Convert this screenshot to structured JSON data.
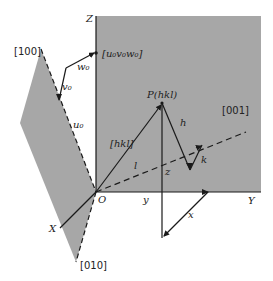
{
  "figure": {
    "type": "crystallographic direction diagram",
    "colors": {
      "plane_fill": "#a7a7a7",
      "line": "#1a1a1a",
      "background": "#ffffff"
    },
    "axes": {
      "z_label": "Z",
      "y_label": "Y",
      "x_label": "X",
      "origin_label": "O"
    },
    "directions": {
      "d100": "[100]",
      "d010": "[010]",
      "d001": "[001]",
      "uvw": "[u₀v₀w₀]",
      "hkl": "[hkl]"
    },
    "point": {
      "label": "P(hkl)"
    },
    "components": {
      "u0": "u₀",
      "v0": "v₀",
      "w0": "w₀",
      "h": "h",
      "k": "k",
      "l": "l",
      "x": "x",
      "y": "y",
      "z": "z"
    }
  }
}
